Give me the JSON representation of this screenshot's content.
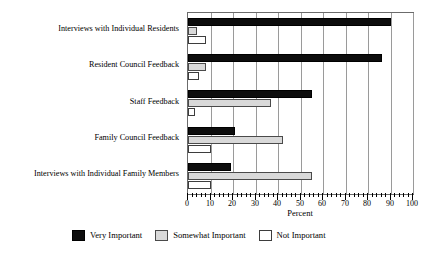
{
  "chart_data": {
    "type": "bar",
    "orientation": "horizontal",
    "title": "",
    "xlabel": "Percent",
    "ylabel": "",
    "xlim": [
      0,
      100
    ],
    "xticks": [
      0,
      10,
      20,
      30,
      40,
      50,
      60,
      70,
      80,
      90,
      100
    ],
    "xticklabels": [
      "0",
      "10",
      "20",
      "30",
      "40",
      "50",
      "60",
      "70",
      "80",
      "90",
      "100"
    ],
    "minor_tick_step": 2,
    "grid": "vertical",
    "legend_position": "below",
    "categories": [
      "Interviews with Individual Residents",
      "Resident Council Feedback",
      "Staff Feedback",
      "Family Council Feedback",
      "Interviews with Individual Family Members"
    ],
    "series": [
      {
        "name": "Very Important",
        "color": "#0d0d0d",
        "values": [
          90,
          86,
          55,
          21,
          19
        ]
      },
      {
        "name": "Somewhat Important",
        "color": "#d9d9d9",
        "values": [
          4,
          8,
          37,
          42,
          55
        ]
      },
      {
        "name": "Not Important",
        "color": "#ffffff",
        "values": [
          8,
          5,
          3,
          10,
          10
        ]
      }
    ]
  },
  "legend": {
    "entries": [
      {
        "label": "Very Important",
        "swatch": "vi"
      },
      {
        "label": "Somewhat Important",
        "swatch": "si"
      },
      {
        "label": "Not Important",
        "swatch": "ni"
      }
    ]
  },
  "axis": {
    "x_title": "Percent"
  }
}
